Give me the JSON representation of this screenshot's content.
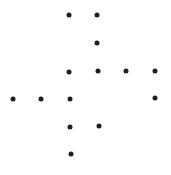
{
  "diagram": {
    "background": "#ffffff",
    "dot_color": "#1f1f1f",
    "dot_size": 5,
    "dots": [
      {
        "x": 69,
        "y": 15
      },
      {
        "x": 97,
        "y": 15
      },
      {
        "x": 97,
        "y": 43
      },
      {
        "x": 69,
        "y": 72
      },
      {
        "x": 98,
        "y": 71
      },
      {
        "x": 126,
        "y": 71
      },
      {
        "x": 155,
        "y": 71
      },
      {
        "x": 13,
        "y": 99
      },
      {
        "x": 41,
        "y": 99
      },
      {
        "x": 70,
        "y": 99
      },
      {
        "x": 155,
        "y": 98
      },
      {
        "x": 70,
        "y": 127
      },
      {
        "x": 99,
        "y": 126
      },
      {
        "x": 71,
        "y": 154
      }
    ]
  }
}
